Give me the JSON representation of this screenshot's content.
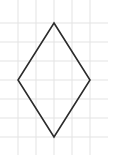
{
  "diagram": {
    "type": "rhombus-on-grid",
    "canvas": {
      "width": 114,
      "height": 159
    },
    "grid": {
      "vertical_lines_x": [
        18,
        36,
        54,
        72,
        90
      ],
      "horizontal_lines_y": [
        23,
        42,
        61,
        80,
        99,
        118,
        137
      ],
      "extent": {
        "x_min": 0,
        "x_max": 108,
        "y_min": 0,
        "y_max": 155
      },
      "color": "#e3e3e3"
    },
    "shape": {
      "name": "rhombus",
      "vertices": [
        {
          "label": "top",
          "x": 54,
          "y": 23
        },
        {
          "label": "right",
          "x": 90,
          "y": 80
        },
        {
          "label": "bottom",
          "x": 54,
          "y": 137
        },
        {
          "label": "left",
          "x": 18,
          "y": 80
        }
      ],
      "stroke": "#2b2b2b",
      "stroke_width": 1.6
    }
  }
}
